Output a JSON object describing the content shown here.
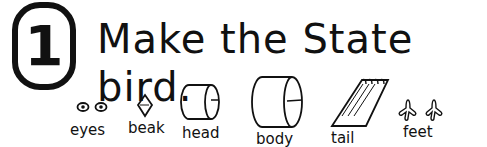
{
  "step": {
    "number": "1"
  },
  "title": "Make the State bird.",
  "parts": [
    {
      "id": "eyes",
      "label": "eyes"
    },
    {
      "id": "beak",
      "label": "beak"
    },
    {
      "id": "head",
      "label": "head"
    },
    {
      "id": "body",
      "label": "body"
    },
    {
      "id": "tail",
      "label": "tail"
    },
    {
      "id": "feet",
      "label": "feet"
    }
  ]
}
